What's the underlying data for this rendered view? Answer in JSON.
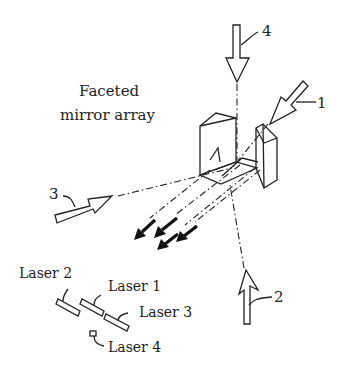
{
  "diagram": {
    "title_line1": "Faceted",
    "title_line2": "mirror array",
    "beam_labels": [
      "1",
      "2",
      "3",
      "4"
    ],
    "lasers": [
      "Laser 1",
      "Laser 2",
      "Laser 3",
      "Laser 4"
    ],
    "colors": {
      "line": "#222222",
      "background": "#ffffff"
    }
  }
}
